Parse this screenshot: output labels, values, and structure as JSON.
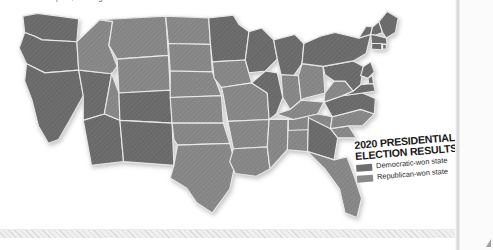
{
  "document": {
    "top_body_text": "polls, showing the data.",
    "page_background": "#ffffff",
    "page_edge_color": "#cfcfcf"
  },
  "map": {
    "name": "united-states-election-map",
    "projection_note": "contiguous united states",
    "border_color": "#e8e8e8",
    "democratic_fill": "#6e6e6e",
    "republican_fill": "#8a8a8a",
    "states": [
      {
        "code": "WA",
        "name": "Washington",
        "party": "democratic"
      },
      {
        "code": "OR",
        "name": "Oregon",
        "party": "democratic"
      },
      {
        "code": "CA",
        "name": "California",
        "party": "democratic"
      },
      {
        "code": "NV",
        "name": "Nevada",
        "party": "democratic"
      },
      {
        "code": "ID",
        "name": "Idaho",
        "party": "republican"
      },
      {
        "code": "MT",
        "name": "Montana",
        "party": "republican"
      },
      {
        "code": "WY",
        "name": "Wyoming",
        "party": "republican"
      },
      {
        "code": "UT",
        "name": "Utah",
        "party": "republican"
      },
      {
        "code": "AZ",
        "name": "Arizona",
        "party": "democratic"
      },
      {
        "code": "CO",
        "name": "Colorado",
        "party": "democratic"
      },
      {
        "code": "NM",
        "name": "New Mexico",
        "party": "democratic"
      },
      {
        "code": "ND",
        "name": "North Dakota",
        "party": "republican"
      },
      {
        "code": "SD",
        "name": "South Dakota",
        "party": "republican"
      },
      {
        "code": "NE",
        "name": "Nebraska",
        "party": "republican"
      },
      {
        "code": "KS",
        "name": "Kansas",
        "party": "republican"
      },
      {
        "code": "OK",
        "name": "Oklahoma",
        "party": "republican"
      },
      {
        "code": "TX",
        "name": "Texas",
        "party": "republican"
      },
      {
        "code": "MN",
        "name": "Minnesota",
        "party": "democratic"
      },
      {
        "code": "IA",
        "name": "Iowa",
        "party": "republican"
      },
      {
        "code": "MO",
        "name": "Missouri",
        "party": "republican"
      },
      {
        "code": "AR",
        "name": "Arkansas",
        "party": "republican"
      },
      {
        "code": "LA",
        "name": "Louisiana",
        "party": "republican"
      },
      {
        "code": "WI",
        "name": "Wisconsin",
        "party": "democratic"
      },
      {
        "code": "IL",
        "name": "Illinois",
        "party": "democratic"
      },
      {
        "code": "MS",
        "name": "Mississippi",
        "party": "republican"
      },
      {
        "code": "AL",
        "name": "Alabama",
        "party": "republican"
      },
      {
        "code": "MI",
        "name": "Michigan",
        "party": "democratic"
      },
      {
        "code": "IN",
        "name": "Indiana",
        "party": "republican"
      },
      {
        "code": "OH",
        "name": "Ohio",
        "party": "republican"
      },
      {
        "code": "KY",
        "name": "Kentucky",
        "party": "republican"
      },
      {
        "code": "TN",
        "name": "Tennessee",
        "party": "republican"
      },
      {
        "code": "GA",
        "name": "Georgia",
        "party": "democratic"
      },
      {
        "code": "FL",
        "name": "Florida",
        "party": "republican"
      },
      {
        "code": "SC",
        "name": "South Carolina",
        "party": "republican"
      },
      {
        "code": "NC",
        "name": "North Carolina",
        "party": "republican"
      },
      {
        "code": "VA",
        "name": "Virginia",
        "party": "democratic"
      },
      {
        "code": "WV",
        "name": "West Virginia",
        "party": "republican"
      },
      {
        "code": "PA",
        "name": "Pennsylvania",
        "party": "democratic"
      },
      {
        "code": "NY",
        "name": "New York",
        "party": "democratic"
      },
      {
        "code": "VT",
        "name": "Vermont",
        "party": "democratic"
      },
      {
        "code": "NH",
        "name": "New Hampshire",
        "party": "democratic"
      },
      {
        "code": "ME",
        "name": "Maine",
        "party": "democratic"
      },
      {
        "code": "MA",
        "name": "Massachusetts",
        "party": "democratic"
      },
      {
        "code": "RI",
        "name": "Rhode Island",
        "party": "democratic"
      },
      {
        "code": "CT",
        "name": "Connecticut",
        "party": "democratic"
      },
      {
        "code": "NJ",
        "name": "New Jersey",
        "party": "democratic"
      },
      {
        "code": "DE",
        "name": "Delaware",
        "party": "democratic"
      },
      {
        "code": "MD",
        "name": "Maryland",
        "party": "democratic"
      }
    ]
  },
  "legend": {
    "title_line_1": "2020 PRESIDENTIAL",
    "title_line_2": "ELECTION RESULTS",
    "entries": [
      {
        "label": "Democratic-won state",
        "swatch_color": "#6e6e6e"
      },
      {
        "label": "Republican-won state",
        "swatch_color": "#8a8a8a"
      }
    ]
  }
}
